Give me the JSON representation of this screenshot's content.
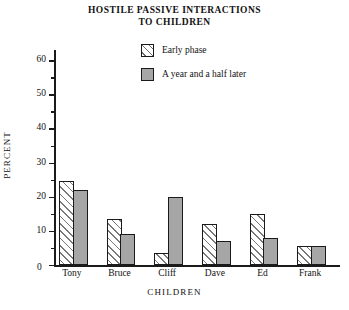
{
  "chart_data": {
    "type": "bar",
    "title": "HOSTILE PASSIVE INTERACTIONS TO CHILDREN",
    "title_line1": "HOSTILE PASSIVE INTERACTIONS",
    "title_line2": "TO CHILDREN",
    "xlabel": "CHILDREN",
    "ylabel": "PERCENT",
    "categories": [
      "Tony",
      "Bruce",
      "Cliff",
      "Dave",
      "Ed",
      "Frank"
    ],
    "series": [
      {
        "name": "Early phase",
        "style": "hatched",
        "values": [
          24.5,
          13.5,
          3.5,
          12,
          15,
          5.5
        ]
      },
      {
        "name": "A year and a half later",
        "style": "solid-gray",
        "values": [
          22,
          9,
          20,
          7,
          8,
          5.5
        ]
      }
    ],
    "ylim": [
      0,
      63
    ],
    "yticks": [
      0,
      10,
      20,
      30,
      40,
      50,
      60
    ],
    "ytick_labels": [
      "0",
      "10",
      "20",
      "30",
      "40",
      "50",
      "60"
    ],
    "yminor_step": 5,
    "grid": false,
    "legend_position": "top-center"
  },
  "legend": {
    "items": [
      {
        "label": "Early phase",
        "swatch": "hatch"
      },
      {
        "label": "A year and a half later",
        "swatch": "solid"
      }
    ]
  },
  "colors": {
    "axis": "#1a1a1a",
    "bar_gray": "#a6a6a6",
    "hatch_line": "#787878",
    "background": "#ffffff",
    "text": "#111111"
  }
}
